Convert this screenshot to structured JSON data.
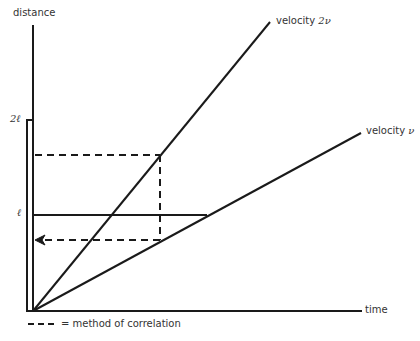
{
  "diagram": {
    "y_axis_label": "distance",
    "x_axis_label": "time",
    "tick_2l": "2ℓ",
    "tick_l": "ℓ",
    "line_fast": {
      "prefix": "velocity ",
      "symbol": "2ν"
    },
    "line_slow": {
      "prefix": "velocity ",
      "symbol": "ν"
    },
    "legend": {
      "dash_sample": "– – –",
      "text": "= method of correlation"
    },
    "colors": {
      "ink": "#1a1a1a",
      "text": "#333333"
    }
  }
}
